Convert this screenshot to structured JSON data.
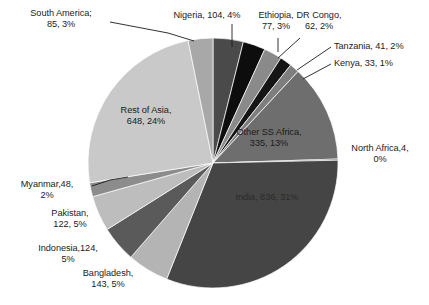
{
  "chart_data": {
    "type": "pie",
    "title": "",
    "subtitle": "",
    "xlabel": "",
    "ylabel": "",
    "legend_position": "none",
    "grid": false,
    "total": 2662,
    "units": "millions",
    "categories": [
      "Nigeria",
      "Ethiopia",
      "DR Congo",
      "Tanzania",
      "Kenya",
      "Other SS Africa",
      "North Africa",
      "India",
      "Bangladesh",
      "Indonesia",
      "Pakistan",
      "Myanmar",
      "Rest of Asia",
      "South America"
    ],
    "values": [
      104,
      77,
      62,
      41,
      33,
      335,
      4,
      836,
      143,
      124,
      122,
      48,
      648,
      85
    ],
    "percents": [
      4,
      3,
      2,
      2,
      1,
      13,
      0,
      31,
      5,
      5,
      5,
      2,
      24,
      3
    ],
    "colors": [
      "#4a4a4a",
      "#0d0d0d",
      "#8a8a8a",
      "#151515",
      "#7e7e7e",
      "#6e6e6e",
      "#2a2a2a",
      "#454545",
      "#b4b4b4",
      "#5a5a5a",
      "#bdbdbd",
      "#8c8c8c",
      "#c9c9c9",
      "#a8a8a8"
    ]
  },
  "labels": {
    "south_america": "South America;\n85, 3%",
    "nigeria": "Nigeria, 104, 4%",
    "ethiopia": "Ethiopia,\n77, 3%",
    "dr_congo": "DR Congo,\n62, 2%",
    "tanzania": "Tanzania, 41, 2%",
    "kenya": "Kenya, 33, 1%",
    "rest_of_asia": "Rest of Asia,\n648, 24%",
    "other_ss_africa": "Other SS Africa,\n335, 13%",
    "north_africa": "North Africa,4,\n0%",
    "india": "India, 836, 31%",
    "myanmar": "Myanmar,48,\n2%",
    "pakistan": "Pakistan,\n122, 5%",
    "indonesia": "Indonesia,124,\n5%",
    "bangladesh": "Bangladesh,\n143, 5%"
  },
  "geometry": {
    "cx": 213,
    "cy": 163,
    "r": 125
  }
}
